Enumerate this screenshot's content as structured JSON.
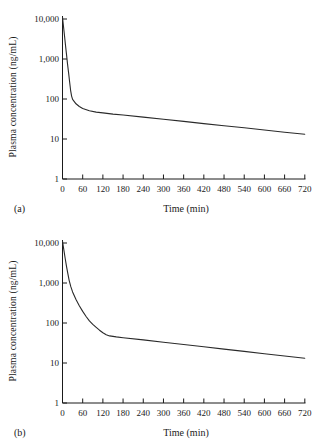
{
  "figure": {
    "background_color": "#ffffff",
    "text_color": "#1a1a1a",
    "curve_color": "#2a2a2a"
  },
  "chart_data": [
    {
      "type": "line",
      "panel_label": "(a)",
      "xlabel": "Time (min)",
      "ylabel": "Plasma concentration (ng/mL)",
      "y_scale": "log",
      "xlim": [
        0,
        720
      ],
      "ylim": [
        1,
        10000
      ],
      "grid": false,
      "legend": "none",
      "x_ticks": [
        0,
        60,
        120,
        180,
        240,
        300,
        360,
        420,
        480,
        540,
        600,
        660,
        720
      ],
      "y_ticks": [
        {
          "value": 10000,
          "label": "10,000"
        },
        {
          "value": 1000,
          "label": "1,000"
        },
        {
          "value": 100,
          "label": "100"
        },
        {
          "value": 10,
          "label": "10"
        },
        {
          "value": 1,
          "label": "1"
        }
      ],
      "series": [
        {
          "name": "plasma-concentration-iv-bolus-rapid-distribution",
          "points": [
            [
              0,
              11000
            ],
            [
              3,
              6500
            ],
            [
              6,
              3800
            ],
            [
              9,
              2200
            ],
            [
              12,
              1300
            ],
            [
              15,
              760
            ],
            [
              18,
              450
            ],
            [
              21,
              270
            ],
            [
              24,
              165
            ],
            [
              27,
              118
            ],
            [
              30,
              98
            ],
            [
              40,
              76
            ],
            [
              50,
              65
            ],
            [
              60,
              58
            ],
            [
              80,
              51
            ],
            [
              100,
              47
            ],
            [
              120,
              45
            ],
            [
              150,
              42
            ],
            [
              180,
              39.8
            ],
            [
              240,
              35.2
            ],
            [
              300,
              31.1
            ],
            [
              360,
              27.5
            ],
            [
              420,
              24.3
            ],
            [
              480,
              21.5
            ],
            [
              540,
              19
            ],
            [
              600,
              16.8
            ],
            [
              660,
              14.8
            ],
            [
              720,
              13.1
            ]
          ]
        }
      ]
    },
    {
      "type": "line",
      "panel_label": "(b)",
      "xlabel": "Time (min)",
      "ylabel": "Plasma concentration (ng/mL)",
      "y_scale": "log",
      "xlim": [
        0,
        720
      ],
      "ylim": [
        1,
        10000
      ],
      "grid": false,
      "legend": "none",
      "x_ticks": [
        0,
        60,
        120,
        180,
        240,
        300,
        360,
        420,
        480,
        540,
        600,
        660,
        720
      ],
      "y_ticks": [
        {
          "value": 10000,
          "label": "10,000"
        },
        {
          "value": 1000,
          "label": "1,000"
        },
        {
          "value": 100,
          "label": "100"
        },
        {
          "value": 10,
          "label": "10"
        },
        {
          "value": 1,
          "label": "1"
        }
      ],
      "series": [
        {
          "name": "plasma-concentration-iv-bolus-slow-distribution",
          "points": [
            [
              0,
              11000
            ],
            [
              4,
              6800
            ],
            [
              8,
              4100
            ],
            [
              12,
              2600
            ],
            [
              16,
              1700
            ],
            [
              20,
              1150
            ],
            [
              25,
              800
            ],
            [
              30,
              600
            ],
            [
              40,
              390
            ],
            [
              50,
              270
            ],
            [
              60,
              195
            ],
            [
              70,
              145
            ],
            [
              80,
              113
            ],
            [
              90,
              93
            ],
            [
              100,
              78
            ],
            [
              110,
              66
            ],
            [
              120,
              57
            ],
            [
              130,
              51
            ],
            [
              140,
              47.5
            ],
            [
              160,
              45
            ],
            [
              180,
              43
            ],
            [
              240,
              37.8
            ],
            [
              300,
              33.1
            ],
            [
              360,
              29
            ],
            [
              420,
              25.4
            ],
            [
              480,
              22.3
            ],
            [
              540,
              19.5
            ],
            [
              600,
              17.1
            ],
            [
              660,
              15
            ],
            [
              720,
              13.1
            ]
          ]
        }
      ]
    }
  ]
}
